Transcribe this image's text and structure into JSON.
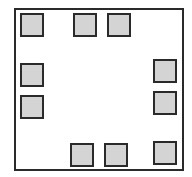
{
  "diagram": {
    "frame": {
      "x": 14,
      "y": 8,
      "w": 170,
      "h": 163,
      "border": "#2a2a2a",
      "fill": "#ffffff"
    },
    "cell_style": {
      "fill": "#d4d4d4",
      "border": "#2a2a2a",
      "size": 24
    },
    "cells": [
      {
        "id": "top-left",
        "x": 20,
        "y": 13
      },
      {
        "id": "top-middle-1",
        "x": 73,
        "y": 13
      },
      {
        "id": "top-middle-2",
        "x": 107,
        "y": 13
      },
      {
        "id": "left-upper",
        "x": 20,
        "y": 63
      },
      {
        "id": "left-lower",
        "x": 20,
        "y": 95
      },
      {
        "id": "right-upper",
        "x": 153,
        "y": 59
      },
      {
        "id": "right-lower",
        "x": 153,
        "y": 91
      },
      {
        "id": "bottom-middle-1",
        "x": 70,
        "y": 143
      },
      {
        "id": "bottom-middle-2",
        "x": 104,
        "y": 143
      },
      {
        "id": "bottom-right",
        "x": 153,
        "y": 141
      }
    ]
  }
}
